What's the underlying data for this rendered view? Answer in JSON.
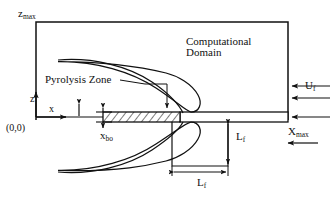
{
  "figure": {
    "colors": {
      "line": "#111111",
      "background": "#ffffff",
      "hatch": "#111111"
    }
  },
  "labels": {
    "z_max": {
      "base": "z",
      "sub": "max"
    },
    "origin": "(0,0)",
    "z_axis": "z",
    "x_axis": "x",
    "pyrolysis_zone": "Pyrolysis Zone",
    "x_bo": {
      "base": "x",
      "sub": "bo"
    },
    "computational_domain": {
      "line1": "Computational",
      "line2": "Domain"
    },
    "u_f": {
      "base": "U",
      "sub": "f"
    },
    "x_max": {
      "base": "X",
      "sub": "max"
    },
    "L_f_vertical": {
      "base": "L",
      "sub": "f"
    },
    "L_f_horizontal": {
      "base": "L",
      "sub": "f"
    }
  },
  "geometry": {
    "domain_box": {
      "left": 36,
      "top": 22,
      "right": 288,
      "bottom": 120
    },
    "plate": {
      "left": 103,
      "right": 288,
      "top": 112,
      "bottom": 122
    },
    "pyrolysis_zone": {
      "left": 103,
      "right": 180,
      "top": 112,
      "bottom": 122
    },
    "recirc_box": {
      "left": 172,
      "right": 228,
      "top": 122,
      "bottom": 166
    },
    "inflow_arrows": 3,
    "axis_origin": {
      "x": 36,
      "y": 117
    }
  }
}
